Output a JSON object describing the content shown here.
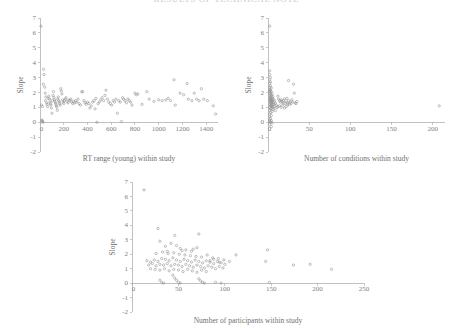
{
  "figure": {
    "title_fragment": "RESULTS OF TECHNICAL NOTE",
    "title_left_fragment": "A",
    "background_color": "#ffffff",
    "marker_color": "#8c8c8c",
    "axis_color": "#a6a6a6",
    "text_color": "#707070"
  },
  "chart_data": [
    {
      "id": "panel-a",
      "type": "scatter",
      "title": "",
      "xlabel": "RT range (young) within study",
      "ylabel": "Slope",
      "xlim": [
        0,
        1500
      ],
      "ylim": [
        -2,
        7
      ],
      "xticks": [
        0,
        200,
        400,
        600,
        800,
        1000,
        1200,
        1400
      ],
      "yticks": [
        -2,
        -1,
        0,
        1,
        2,
        3,
        4,
        5,
        6,
        7
      ],
      "grid": false,
      "legend": "none",
      "marker": "open-circle",
      "points": [
        [
          8,
          6.45
        ],
        [
          14,
          0.1
        ],
        [
          18,
          0.15
        ],
        [
          22,
          0.05
        ],
        [
          12,
          1.15
        ],
        [
          20,
          1.05
        ],
        [
          26,
          0.0
        ],
        [
          30,
          3.55
        ],
        [
          34,
          3.2
        ],
        [
          28,
          2.55
        ],
        [
          40,
          2.35
        ],
        [
          44,
          1.95
        ],
        [
          50,
          1.7
        ],
        [
          46,
          1.45
        ],
        [
          56,
          1.3
        ],
        [
          60,
          1.2
        ],
        [
          64,
          1.05
        ],
        [
          70,
          1.6
        ],
        [
          74,
          1.75
        ],
        [
          80,
          1.55
        ],
        [
          84,
          1.35
        ],
        [
          88,
          1.25
        ],
        [
          92,
          1.15
        ],
        [
          96,
          0.95
        ],
        [
          100,
          0.6
        ],
        [
          104,
          1.45
        ],
        [
          110,
          1.8
        ],
        [
          114,
          2.05
        ],
        [
          118,
          1.65
        ],
        [
          122,
          1.5
        ],
        [
          126,
          1.4
        ],
        [
          130,
          1.3
        ],
        [
          134,
          1.2
        ],
        [
          138,
          1.1
        ],
        [
          142,
          1.0
        ],
        [
          146,
          0.8
        ],
        [
          150,
          1.55
        ],
        [
          154,
          1.7
        ],
        [
          158,
          1.45
        ],
        [
          162,
          1.35
        ],
        [
          166,
          1.25
        ],
        [
          170,
          1.15
        ],
        [
          175,
          2.25
        ],
        [
          180,
          2.1
        ],
        [
          185,
          1.9
        ],
        [
          190,
          1.5
        ],
        [
          195,
          1.35
        ],
        [
          200,
          1.25
        ],
        [
          205,
          1.45
        ],
        [
          212,
          1.55
        ],
        [
          220,
          1.65
        ],
        [
          228,
          1.4
        ],
        [
          236,
          1.3
        ],
        [
          244,
          1.5
        ],
        [
          252,
          1.45
        ],
        [
          260,
          1.55
        ],
        [
          268,
          1.35
        ],
        [
          276,
          1.25
        ],
        [
          284,
          1.4
        ],
        [
          292,
          1.3
        ],
        [
          300,
          1.45
        ],
        [
          310,
          1.35
        ],
        [
          320,
          1.55
        ],
        [
          330,
          1.25
        ],
        [
          340,
          1.15
        ],
        [
          352,
          2.05
        ],
        [
          360,
          2.05
        ],
        [
          370,
          1.45
        ],
        [
          380,
          1.3
        ],
        [
          390,
          1.2
        ],
        [
          400,
          1.35
        ],
        [
          412,
          1.25
        ],
        [
          420,
          0.95
        ],
        [
          432,
          1.1
        ],
        [
          444,
          1.35
        ],
        [
          456,
          1.45
        ],
        [
          464,
          0.9
        ],
        [
          472,
          1.6
        ],
        [
          480,
          0.0
        ],
        [
          490,
          1.25
        ],
        [
          500,
          1.35
        ],
        [
          512,
          1.5
        ],
        [
          524,
          1.65
        ],
        [
          536,
          1.45
        ],
        [
          548,
          1.8
        ],
        [
          556,
          2.15
        ],
        [
          568,
          1.55
        ],
        [
          580,
          1.35
        ],
        [
          592,
          1.25
        ],
        [
          604,
          1.15
        ],
        [
          616,
          1.45
        ],
        [
          628,
          1.35
        ],
        [
          640,
          1.55
        ],
        [
          652,
          0.6
        ],
        [
          664,
          1.45
        ],
        [
          676,
          1.35
        ],
        [
          686,
          0.05
        ],
        [
          696,
          1.65
        ],
        [
          704,
          1.55
        ],
        [
          716,
          1.45
        ],
        [
          728,
          1.3
        ],
        [
          740,
          1.55
        ],
        [
          752,
          1.45
        ],
        [
          764,
          1.35
        ],
        [
          776,
          1.15
        ],
        [
          800,
          1.95
        ],
        [
          812,
          1.85
        ],
        [
          824,
          1.9
        ],
        [
          860,
          1.2
        ],
        [
          900,
          2.05
        ],
        [
          920,
          1.55
        ],
        [
          960,
          1.4
        ],
        [
          1000,
          1.5
        ],
        [
          1030,
          1.45
        ],
        [
          1060,
          1.5
        ],
        [
          1080,
          1.6
        ],
        [
          1100,
          1.45
        ],
        [
          1130,
          2.85
        ],
        [
          1140,
          1.15
        ],
        [
          1180,
          1.95
        ],
        [
          1210,
          1.85
        ],
        [
          1240,
          2.6
        ],
        [
          1250,
          1.55
        ],
        [
          1280,
          1.45
        ],
        [
          1300,
          1.95
        ],
        [
          1320,
          1.55
        ],
        [
          1340,
          1.45
        ],
        [
          1360,
          2.25
        ],
        [
          1380,
          1.55
        ],
        [
          1410,
          1.45
        ],
        [
          1460,
          1.1
        ],
        [
          1480,
          0.55
        ]
      ]
    },
    {
      "id": "panel-b",
      "type": "scatter",
      "title": "",
      "xlabel": "Number of conditions within study",
      "ylabel": "Slope",
      "xlim": [
        0,
        215
      ],
      "ylim": [
        -2,
        7
      ],
      "xticks": [
        0,
        50,
        100,
        150,
        200
      ],
      "yticks": [
        -2,
        -1,
        0,
        1,
        2,
        3,
        4,
        5,
        6,
        7
      ],
      "grid": false,
      "legend": "none",
      "marker": "open-circle",
      "points": [
        [
          2,
          6.45
        ],
        [
          2,
          3.45
        ],
        [
          2,
          3.2
        ],
        [
          3,
          3.0
        ],
        [
          2,
          2.85
        ],
        [
          3,
          2.7
        ],
        [
          2,
          2.6
        ],
        [
          3,
          2.45
        ],
        [
          2,
          2.35
        ],
        [
          4,
          2.3
        ],
        [
          2,
          2.2
        ],
        [
          3,
          2.15
        ],
        [
          2,
          2.1
        ],
        [
          4,
          2.05
        ],
        [
          3,
          2.0
        ],
        [
          2,
          1.95
        ],
        [
          5,
          1.9
        ],
        [
          3,
          1.85
        ],
        [
          2,
          1.8
        ],
        [
          4,
          1.75
        ],
        [
          6,
          1.72
        ],
        [
          3,
          1.68
        ],
        [
          2,
          1.65
        ],
        [
          5,
          1.62
        ],
        [
          4,
          1.58
        ],
        [
          3,
          1.55
        ],
        [
          7,
          1.52
        ],
        [
          2,
          1.5
        ],
        [
          6,
          1.48
        ],
        [
          4,
          1.45
        ],
        [
          3,
          1.42
        ],
        [
          8,
          1.4
        ],
        [
          5,
          1.38
        ],
        [
          2,
          1.35
        ],
        [
          6,
          1.33
        ],
        [
          4,
          1.3
        ],
        [
          9,
          1.28
        ],
        [
          3,
          1.25
        ],
        [
          7,
          1.22
        ],
        [
          5,
          1.2
        ],
        [
          2,
          1.18
        ],
        [
          10,
          1.15
        ],
        [
          4,
          1.12
        ],
        [
          6,
          1.1
        ],
        [
          3,
          1.08
        ],
        [
          8,
          1.05
        ],
        [
          5,
          1.02
        ],
        [
          2,
          1.0
        ],
        [
          11,
          0.98
        ],
        [
          7,
          0.95
        ],
        [
          4,
          0.92
        ],
        [
          3,
          0.9
        ],
        [
          6,
          0.85
        ],
        [
          2,
          0.8
        ],
        [
          9,
          0.78
        ],
        [
          5,
          0.72
        ],
        [
          3,
          0.65
        ],
        [
          2,
          0.55
        ],
        [
          4,
          0.45
        ],
        [
          2,
          0.35
        ],
        [
          3,
          0.25
        ],
        [
          2,
          0.15
        ],
        [
          4,
          0.1
        ],
        [
          2,
          0.05
        ],
        [
          3,
          0.0
        ],
        [
          5,
          -0.05
        ],
        [
          2,
          -0.15
        ],
        [
          4,
          -0.3
        ],
        [
          12,
          1.75
        ],
        [
          13,
          1.55
        ],
        [
          14,
          1.45
        ],
        [
          15,
          1.35
        ],
        [
          16,
          1.5
        ],
        [
          17,
          1.4
        ],
        [
          18,
          1.3
        ],
        [
          19,
          1.45
        ],
        [
          20,
          1.55
        ],
        [
          21,
          1.25
        ],
        [
          22,
          1.35
        ],
        [
          23,
          1.6
        ],
        [
          24,
          1.3
        ],
        [
          25,
          1.45
        ],
        [
          26,
          1.2
        ],
        [
          27,
          1.35
        ],
        [
          28,
          1.25
        ],
        [
          29,
          1.5
        ],
        [
          30,
          1.35
        ],
        [
          31,
          2.55
        ],
        [
          32,
          1.95
        ],
        [
          25,
          2.8
        ],
        [
          33,
          1.3
        ],
        [
          34,
          1.25
        ],
        [
          35,
          1.4
        ],
        [
          12,
          1.05
        ],
        [
          14,
          1.1
        ],
        [
          16,
          1.0
        ],
        [
          18,
          1.15
        ],
        [
          20,
          0.95
        ],
        [
          22,
          1.05
        ],
        [
          24,
          1.15
        ],
        [
          208,
          1.1
        ]
      ]
    },
    {
      "id": "panel-c",
      "type": "scatter",
      "title": "",
      "xlabel": "Number of participants within study",
      "ylabel": "Slope",
      "xlim": [
        0,
        250
      ],
      "ylim": [
        -2,
        7
      ],
      "xticks": [
        0,
        50,
        100,
        150,
        200,
        250
      ],
      "yticks": [
        -2,
        -1,
        0,
        1,
        2,
        3,
        4,
        5,
        6,
        7
      ],
      "grid": false,
      "legend": "none",
      "marker": "open-circle",
      "points": [
        [
          13,
          6.45
        ],
        [
          28,
          3.78
        ],
        [
          46,
          3.3
        ],
        [
          72,
          3.4
        ],
        [
          30,
          2.9
        ],
        [
          36,
          2.55
        ],
        [
          42,
          2.75
        ],
        [
          48,
          2.6
        ],
        [
          52,
          2.4
        ],
        [
          58,
          2.3
        ],
        [
          64,
          2.2
        ],
        [
          70,
          2.45
        ],
        [
          33,
          2.15
        ],
        [
          39,
          2.05
        ],
        [
          45,
          2.1
        ],
        [
          51,
          2.0
        ],
        [
          57,
          1.95
        ],
        [
          63,
          1.9
        ],
        [
          69,
          1.85
        ],
        [
          75,
          1.8
        ],
        [
          81,
          1.95
        ],
        [
          87,
          1.75
        ],
        [
          93,
          1.7
        ],
        [
          99,
          1.6
        ],
        [
          105,
          1.5
        ],
        [
          16,
          1.55
        ],
        [
          20,
          1.45
        ],
        [
          24,
          1.6
        ],
        [
          28,
          1.5
        ],
        [
          32,
          1.7
        ],
        [
          36,
          1.65
        ],
        [
          40,
          1.55
        ],
        [
          44,
          1.75
        ],
        [
          48,
          1.6
        ],
        [
          52,
          1.5
        ],
        [
          56,
          1.65
        ],
        [
          60,
          1.55
        ],
        [
          64,
          1.45
        ],
        [
          68,
          1.6
        ],
        [
          72,
          1.5
        ],
        [
          76,
          1.4
        ],
        [
          80,
          1.55
        ],
        [
          84,
          1.45
        ],
        [
          88,
          1.35
        ],
        [
          92,
          1.5
        ],
        [
          96,
          1.4
        ],
        [
          100,
          1.3
        ],
        [
          18,
          1.25
        ],
        [
          22,
          1.35
        ],
        [
          26,
          1.2
        ],
        [
          30,
          1.3
        ],
        [
          34,
          1.25
        ],
        [
          38,
          1.35
        ],
        [
          42,
          1.2
        ],
        [
          46,
          1.3
        ],
        [
          50,
          1.25
        ],
        [
          54,
          1.15
        ],
        [
          58,
          1.3
        ],
        [
          62,
          1.2
        ],
        [
          66,
          1.1
        ],
        [
          70,
          1.25
        ],
        [
          74,
          1.15
        ],
        [
          78,
          1.05
        ],
        [
          82,
          1.2
        ],
        [
          86,
          1.1
        ],
        [
          90,
          1.0
        ],
        [
          94,
          1.15
        ],
        [
          98,
          1.05
        ],
        [
          20,
          1.0
        ],
        [
          25,
          0.95
        ],
        [
          30,
          0.9
        ],
        [
          35,
          1.0
        ],
        [
          40,
          0.85
        ],
        [
          45,
          0.95
        ],
        [
          50,
          0.9
        ],
        [
          55,
          0.8
        ],
        [
          60,
          0.95
        ],
        [
          65,
          0.85
        ],
        [
          70,
          0.75
        ],
        [
          75,
          0.9
        ],
        [
          80,
          0.8
        ],
        [
          44,
          0.55
        ],
        [
          46,
          0.35
        ],
        [
          48,
          0.2
        ],
        [
          50,
          0.05
        ],
        [
          52,
          0.0
        ],
        [
          72,
          0.3
        ],
        [
          74,
          0.15
        ],
        [
          76,
          0.05
        ],
        [
          78,
          0.0
        ],
        [
          30,
          0.2
        ],
        [
          32,
          0.05
        ],
        [
          34,
          0.0
        ],
        [
          90,
          0.05
        ],
        [
          96,
          0.0
        ],
        [
          112,
          1.95
        ],
        [
          144,
          1.5
        ],
        [
          146,
          2.3
        ],
        [
          148,
          0.05
        ],
        [
          174,
          1.25
        ],
        [
          192,
          1.3
        ],
        [
          215,
          0.95
        ],
        [
          26,
          2.05
        ],
        [
          38,
          2.2
        ],
        [
          54,
          2.25
        ],
        [
          66,
          2.35
        ],
        [
          84,
          1.55
        ],
        [
          88,
          1.65
        ],
        [
          94,
          1.45
        ]
      ]
    }
  ]
}
